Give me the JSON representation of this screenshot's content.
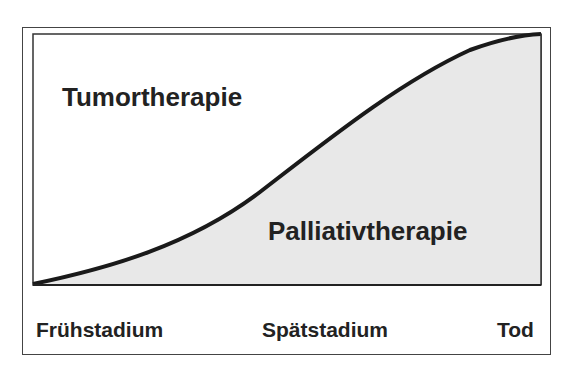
{
  "diagram": {
    "region_labels": {
      "upper": "Tumortherapie",
      "lower": "Palliativtherapie"
    },
    "axis_labels": [
      "Frühstadium",
      "Spätstadium",
      "Tod"
    ],
    "colors": {
      "frame": "#444444",
      "curve": "#1a1a1a",
      "fill_lower": "#e8e8e8",
      "fill_upper": "#ffffff"
    },
    "curve_points": [
      [
        33,
        284
      ],
      [
        150,
        255
      ],
      [
        200,
        235
      ],
      [
        250,
        200
      ],
      [
        300,
        155
      ],
      [
        350,
        117
      ],
      [
        400,
        82
      ],
      [
        450,
        55
      ],
      [
        490,
        41
      ],
      [
        541,
        34
      ]
    ]
  }
}
